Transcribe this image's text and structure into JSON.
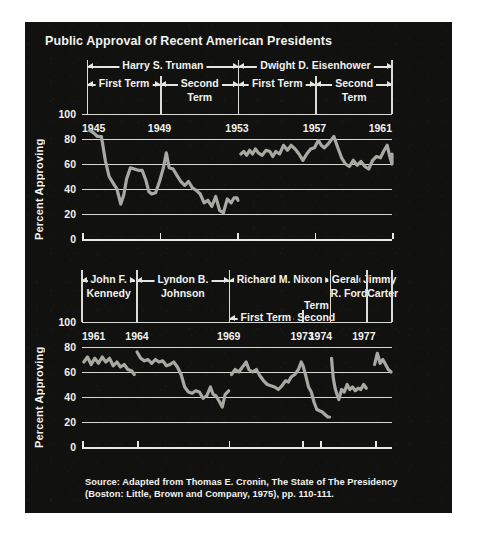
{
  "figure": {
    "title": "Public Approval of Recent American Presidents",
    "source": "Source: Adapted from Thomas E. Cronin, The State of The Presidency\n(Boston: Little, Brown and Company, 1975), pp. 110-111.",
    "background_color": "#111110",
    "line_color": "#a9a9a2",
    "grid_color": "#d8d8d2",
    "text_color": "#f2f2ee"
  },
  "chart_data": [
    {
      "type": "line",
      "id": "upper",
      "title": "Public Approval of Recent American Presidents",
      "xlabel": "",
      "ylabel": "Percent Approving",
      "xlim": [
        1945,
        1961
      ],
      "ylim": [
        0,
        100
      ],
      "yticks": [
        0,
        20,
        40,
        60,
        80,
        100
      ],
      "xticks": [
        1945,
        1949,
        1953,
        1957,
        1961
      ],
      "xtick_labels": [
        "1945",
        "1949",
        "1953",
        "1957",
        "1961"
      ],
      "grid": true,
      "legend": "none",
      "presidents": [
        {
          "name": "Harry S. Truman",
          "start": 1945.3,
          "end": 1953.05,
          "terms": [
            {
              "label": "First Term",
              "start": 1945.3,
              "end": 1949.05,
              "wrap": false
            },
            {
              "label": "Second",
              "label2": "Term",
              "start": 1949.1,
              "end": 1953.05,
              "wrap": true
            }
          ]
        },
        {
          "name": "Dwight D. Eisenhower",
          "start": 1953.1,
          "end": 1961.0,
          "terms": [
            {
              "label": "First Term",
              "start": 1953.1,
              "end": 1957.05,
              "wrap": false
            },
            {
              "label": "Second",
              "label2": "Term",
              "start": 1957.1,
              "end": 1961.0,
              "wrap": true
            }
          ]
        }
      ],
      "series": [
        {
          "name": "Truman approval",
          "points": [
            [
              1945.4,
              87
            ],
            [
              1945.6,
              85
            ],
            [
              1945.8,
              82
            ],
            [
              1946.0,
              82
            ],
            [
              1946.2,
              63
            ],
            [
              1946.4,
              50
            ],
            [
              1946.6,
              45
            ],
            [
              1946.8,
              40
            ],
            [
              1947.0,
              28
            ],
            [
              1947.15,
              35
            ],
            [
              1947.3,
              48
            ],
            [
              1947.5,
              57
            ],
            [
              1947.7,
              56
            ],
            [
              1947.9,
              55
            ],
            [
              1948.1,
              55
            ],
            [
              1948.3,
              47
            ],
            [
              1948.45,
              38
            ],
            [
              1948.6,
              36
            ],
            [
              1948.8,
              37
            ],
            [
              1949.0,
              46
            ],
            [
              1949.2,
              57
            ],
            [
              1949.35,
              69
            ],
            [
              1949.5,
              57
            ],
            [
              1949.7,
              56
            ],
            [
              1949.9,
              51
            ],
            [
              1950.1,
              46
            ],
            [
              1950.3,
              43
            ],
            [
              1950.5,
              46
            ],
            [
              1950.7,
              41
            ],
            [
              1950.9,
              39
            ],
            [
              1951.1,
              36
            ],
            [
              1951.3,
              29
            ],
            [
              1951.5,
              31
            ],
            [
              1951.7,
              26
            ],
            [
              1951.9,
              34
            ],
            [
              1952.1,
              23
            ],
            [
              1952.3,
              21
            ],
            [
              1952.5,
              32
            ],
            [
              1952.7,
              29
            ],
            [
              1952.85,
              33
            ],
            [
              1953.0,
              33
            ],
            [
              1953.05,
              31
            ]
          ]
        },
        {
          "name": "Eisenhower approval",
          "points": [
            [
              1953.2,
              68
            ],
            [
              1953.35,
              70
            ],
            [
              1953.5,
              67
            ],
            [
              1953.65,
              71
            ],
            [
              1953.8,
              68
            ],
            [
              1953.95,
              72
            ],
            [
              1954.1,
              69
            ],
            [
              1954.3,
              67
            ],
            [
              1954.5,
              71
            ],
            [
              1954.7,
              70
            ],
            [
              1954.85,
              66
            ],
            [
              1955.0,
              70
            ],
            [
              1955.2,
              68
            ],
            [
              1955.4,
              75
            ],
            [
              1955.6,
              71
            ],
            [
              1955.8,
              75
            ],
            [
              1956.0,
              72
            ],
            [
              1956.2,
              68
            ],
            [
              1956.4,
              63
            ],
            [
              1956.6,
              68
            ],
            [
              1956.8,
              72
            ],
            [
              1957.0,
              73
            ],
            [
              1957.2,
              79
            ],
            [
              1957.35,
              75
            ],
            [
              1957.5,
              73
            ],
            [
              1957.7,
              76
            ],
            [
              1957.85,
              79
            ],
            [
              1958.0,
              82
            ],
            [
              1958.2,
              73
            ],
            [
              1958.4,
              65
            ],
            [
              1958.6,
              60
            ],
            [
              1958.8,
              58
            ],
            [
              1959.0,
              63
            ],
            [
              1959.2,
              59
            ],
            [
              1959.4,
              62
            ],
            [
              1959.6,
              58
            ],
            [
              1959.8,
              56
            ],
            [
              1960.0,
              63
            ],
            [
              1960.2,
              66
            ],
            [
              1960.4,
              65
            ],
            [
              1960.6,
              71
            ],
            [
              1960.75,
              75
            ],
            [
              1960.9,
              65
            ],
            [
              1961.0,
              60
            ],
            [
              1961.0,
              68
            ]
          ]
        }
      ]
    },
    {
      "type": "line",
      "id": "lower",
      "title": "",
      "xlabel": "",
      "ylabel": "Percent Approving",
      "xlim": [
        1961,
        1977.9
      ],
      "ylim": [
        0,
        100
      ],
      "yticks": [
        0,
        20,
        40,
        60,
        80,
        100
      ],
      "xticks": [
        1961,
        1964,
        1969,
        1973,
        1974,
        1977
      ],
      "xtick_labels": [
        "1961",
        "1964",
        "1969",
        "1973",
        "1974",
        "1977"
      ],
      "grid": true,
      "legend": "none",
      "presidents": [
        {
          "name": "John F.",
          "name2": "Kennedy",
          "start": 1961.0,
          "end": 1963.9,
          "wrap": true,
          "terms": []
        },
        {
          "name": "Lyndon B.",
          "name2": "Johnson",
          "start": 1964.0,
          "end": 1969.0,
          "wrap": true,
          "terms": []
        },
        {
          "name": "Richard M. Nixon",
          "start": 1969.05,
          "end": 1974.5,
          "terms": [
            {
              "label": "First Term",
              "start": 1969.05,
              "end": 1973.0,
              "wrap": false
            },
            {
              "label": "Second",
              "label2": "Term",
              "start": 1973.05,
              "end": 1974.5,
              "wrap": true
            }
          ]
        },
        {
          "name": "Gerald",
          "name2": "R. Ford",
          "start": 1974.55,
          "end": 1976.5,
          "wrap": true,
          "terms": []
        },
        {
          "name": "Jimmy",
          "name2": "Carter",
          "start": 1976.55,
          "end": 1977.9,
          "wrap": true,
          "terms": []
        }
      ],
      "series": [
        {
          "name": "Kennedy approval",
          "points": [
            [
              1961.1,
              68
            ],
            [
              1961.3,
              72
            ],
            [
              1961.5,
              66
            ],
            [
              1961.7,
              71
            ],
            [
              1961.9,
              67
            ],
            [
              1962.1,
              72
            ],
            [
              1962.3,
              68
            ],
            [
              1962.5,
              71
            ],
            [
              1962.7,
              65
            ],
            [
              1962.9,
              68
            ],
            [
              1963.1,
              64
            ],
            [
              1963.3,
              66
            ],
            [
              1963.5,
              62
            ],
            [
              1963.7,
              61
            ],
            [
              1963.85,
              58
            ]
          ]
        },
        {
          "name": "Johnson approval",
          "points": [
            [
              1964.0,
              76
            ],
            [
              1964.2,
              71
            ],
            [
              1964.4,
              69
            ],
            [
              1964.6,
              70
            ],
            [
              1964.8,
              67
            ],
            [
              1965.0,
              70
            ],
            [
              1965.2,
              68
            ],
            [
              1965.4,
              69
            ],
            [
              1965.6,
              65
            ],
            [
              1965.8,
              66
            ],
            [
              1966.0,
              68
            ],
            [
              1966.2,
              64
            ],
            [
              1966.4,
              58
            ],
            [
              1966.6,
              48
            ],
            [
              1966.8,
              44
            ],
            [
              1967.0,
              43
            ],
            [
              1967.2,
              45
            ],
            [
              1967.4,
              44
            ],
            [
              1967.6,
              39
            ],
            [
              1967.8,
              41
            ],
            [
              1968.0,
              48
            ],
            [
              1968.15,
              42
            ],
            [
              1968.3,
              41
            ],
            [
              1968.5,
              36
            ],
            [
              1968.65,
              32
            ],
            [
              1968.8,
              42
            ],
            [
              1969.0,
              45
            ]
          ]
        },
        {
          "name": "Nixon approval",
          "points": [
            [
              1969.15,
              58
            ],
            [
              1969.35,
              62
            ],
            [
              1969.55,
              60
            ],
            [
              1969.75,
              64
            ],
            [
              1969.95,
              68
            ],
            [
              1970.1,
              62
            ],
            [
              1970.3,
              60
            ],
            [
              1970.5,
              62
            ],
            [
              1970.7,
              57
            ],
            [
              1970.9,
              53
            ],
            [
              1971.1,
              50
            ],
            [
              1971.3,
              49
            ],
            [
              1971.5,
              48
            ],
            [
              1971.7,
              46
            ],
            [
              1971.9,
              49
            ],
            [
              1972.1,
              53
            ],
            [
              1972.25,
              52
            ],
            [
              1972.4,
              56
            ],
            [
              1972.6,
              58
            ],
            [
              1972.8,
              62
            ],
            [
              1972.95,
              68
            ],
            [
              1973.05,
              65
            ],
            [
              1973.2,
              57
            ],
            [
              1973.35,
              48
            ],
            [
              1973.5,
              44
            ],
            [
              1973.65,
              36
            ],
            [
              1973.8,
              30
            ],
            [
              1973.95,
              29
            ],
            [
              1974.1,
              28
            ],
            [
              1974.25,
              26
            ],
            [
              1974.4,
              24
            ],
            [
              1974.5,
              24
            ]
          ]
        },
        {
          "name": "Ford approval",
          "points": [
            [
              1974.6,
              71
            ],
            [
              1974.7,
              55
            ],
            [
              1974.8,
              47
            ],
            [
              1974.9,
              42
            ],
            [
              1975.0,
              38
            ],
            [
              1975.15,
              46
            ],
            [
              1975.3,
              44
            ],
            [
              1975.45,
              50
            ],
            [
              1975.6,
              46
            ],
            [
              1975.75,
              48
            ],
            [
              1975.9,
              45
            ],
            [
              1976.05,
              47
            ],
            [
              1976.2,
              46
            ],
            [
              1976.35,
              50
            ],
            [
              1976.5,
              47
            ]
          ]
        },
        {
          "name": "Carter approval",
          "points": [
            [
              1976.95,
              66
            ],
            [
              1977.1,
              75
            ],
            [
              1977.25,
              67
            ],
            [
              1977.4,
              70
            ],
            [
              1977.55,
              66
            ],
            [
              1977.7,
              62
            ],
            [
              1977.85,
              60
            ]
          ]
        }
      ]
    }
  ]
}
